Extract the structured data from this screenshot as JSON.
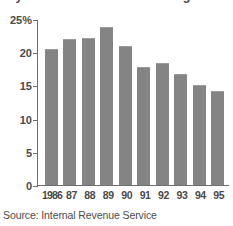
{
  "chart_data": {
    "type": "bar",
    "title": "by the IRS has been decreasing since 1986.",
    "categories": [
      "1986",
      "87",
      "88",
      "89",
      "90",
      "91",
      "92",
      "93",
      "94",
      "95"
    ],
    "values": [
      20.6,
      22.1,
      22.3,
      23.9,
      21.0,
      17.9,
      18.5,
      16.8,
      15.1,
      14.2
    ],
    "xlabel": "",
    "ylabel": "",
    "ylim": [
      0,
      25
    ],
    "y_ticks": [
      0,
      5,
      10,
      15,
      20,
      25
    ],
    "y_tick_labels": [
      "0",
      "5",
      "10",
      "15",
      "20",
      "25%"
    ],
    "grid": false,
    "legend": null,
    "series": [
      {
        "name": "Audit rate",
        "values": [
          20.6,
          22.1,
          22.3,
          23.9,
          21.0,
          17.9,
          18.5,
          16.8,
          15.1,
          14.2
        ]
      }
    ],
    "bar_color": "#848484",
    "background_color": "#ffffff",
    "axis_color": "#6f6f6f"
  },
  "source": {
    "text": "Source: Internal Revenue Service"
  }
}
